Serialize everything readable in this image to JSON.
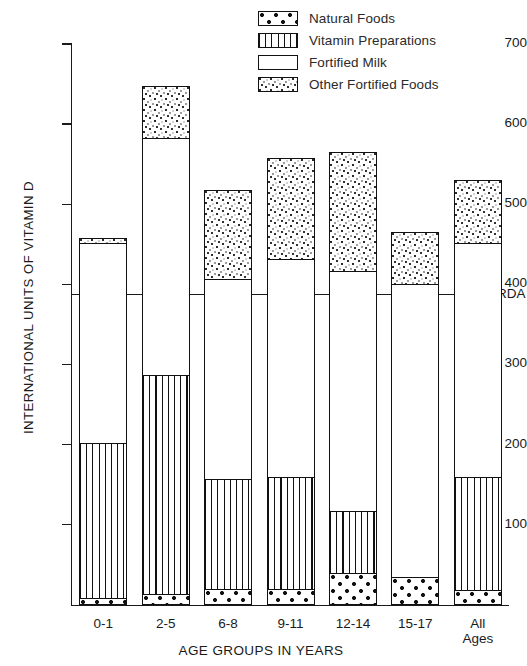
{
  "chart_data": {
    "type": "bar",
    "title": "",
    "subtitle": "",
    "xlabel": "AGE GROUPS IN YEARS",
    "ylabel": "INTERNATIONAL UNITS OF VITAMIN D",
    "stacked": true,
    "grid": false,
    "legend_position": "top-right",
    "ylim": [
      0,
      700
    ],
    "yticks": [
      100,
      200,
      300,
      400,
      500,
      600,
      700
    ],
    "ytick_labels": [
      "100",
      "200",
      "300",
      "400",
      "500",
      "600",
      "700"
    ],
    "categories": [
      "0-1",
      "2-5",
      "6-8",
      "9-11",
      "12-14",
      "15-17",
      "All\nAges"
    ],
    "category_labels": [
      {
        "line1": "0-1",
        "line2": ""
      },
      {
        "line1": "2-5",
        "line2": ""
      },
      {
        "line1": "6-8",
        "line2": ""
      },
      {
        "line1": "9-11",
        "line2": ""
      },
      {
        "line1": "12-14",
        "line2": ""
      },
      {
        "line1": "15-17",
        "line2": ""
      },
      {
        "line1": "All",
        "line2": "Ages"
      }
    ],
    "series": [
      {
        "name": "Natural Foods",
        "pattern": "dots-large",
        "values": [
          8,
          14,
          20,
          20,
          40,
          35,
          18
        ]
      },
      {
        "name": "Vitamin Preparations",
        "pattern": "vertical-lines",
        "values": [
          194,
          273,
          137,
          140,
          77,
          0,
          142
        ]
      },
      {
        "name": "Fortified Milk",
        "pattern": "white",
        "values": [
          250,
          296,
          250,
          272,
          300,
          365,
          292
        ]
      },
      {
        "name": "Other Fortified Foods",
        "pattern": "speckle",
        "values": [
          6,
          65,
          111,
          126,
          148,
          65,
          78
        ]
      }
    ],
    "totals": [
      458,
      648,
      518,
      558,
      565,
      465,
      530
    ],
    "annotations": [
      {
        "label": "RDA",
        "type": "horizontal-line",
        "value": 385
      }
    ]
  },
  "legend": {
    "items": [
      {
        "label": "Natural Foods",
        "pattern": "dots-large"
      },
      {
        "label": "Vitamin Preparations",
        "pattern": "vertical-lines"
      },
      {
        "label": "Fortified Milk",
        "pattern": "white"
      },
      {
        "label": "Other Fortified Foods",
        "pattern": "speckle"
      }
    ]
  },
  "axes": {
    "y_title": "INTERNATIONAL UNITS OF VITAMIN D",
    "x_title": "AGE GROUPS IN YEARS"
  },
  "colors": {
    "ink": "#1a1a1a",
    "background": "#ffffff"
  }
}
